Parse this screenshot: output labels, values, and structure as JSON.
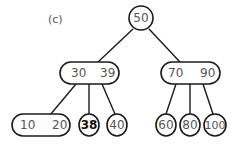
{
  "caption": "(c)",
  "tree": {
    "root": {
      "keys": [
        "50"
      ]
    },
    "internal": [
      {
        "keys": [
          "30",
          "39"
        ]
      },
      {
        "keys": [
          "70",
          "90"
        ]
      }
    ],
    "leaves": [
      {
        "keys": [
          "10",
          "20"
        ]
      },
      {
        "keys": [
          "38"
        ],
        "highlighted": true
      },
      {
        "keys": [
          "40"
        ]
      },
      {
        "keys": [
          "60"
        ]
      },
      {
        "keys": [
          "80"
        ]
      },
      {
        "keys": [
          "100"
        ]
      }
    ]
  }
}
